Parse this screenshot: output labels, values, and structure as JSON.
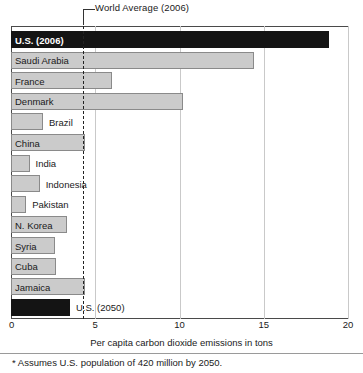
{
  "chart_data": {
    "type": "bar",
    "orientation": "horizontal",
    "title": "",
    "xlabel": "Per capita carbon dioxide emissions in tons",
    "ylabel": "",
    "xlim": [
      0,
      20
    ],
    "xticks": [
      "0",
      "5",
      "10",
      "15",
      "20"
    ],
    "xtick_values": [
      0,
      5,
      10,
      15,
      20
    ],
    "grid": true,
    "legend": "none",
    "categories": [
      "U.S. (2006)",
      "Saudi Arabia",
      "France",
      "Denmark",
      "Brazil",
      "China",
      "India",
      "Indonesia",
      "Pakistan",
      "N. Korea",
      "Syria",
      "Cuba",
      "Jamaica",
      "U.S. (2050)"
    ],
    "values": [
      18.9,
      14.4,
      6.0,
      10.2,
      1.9,
      4.4,
      1.1,
      1.7,
      0.9,
      3.3,
      2.6,
      2.7,
      4.4,
      3.5
    ],
    "highlight_categories": [
      "U.S. (2006)",
      "U.S. (2050)"
    ],
    "annotations": [
      {
        "name": "world-average",
        "label": "World Average (2006)",
        "value": 4.3,
        "style": "dashed vertical line"
      }
    ],
    "footnote": "* Assumes U.S. population of 420 million by 2050.",
    "colors": {
      "bar_fill": "#cbcbcb",
      "bar_border": "#8a8a8a",
      "highlight_fill": "#141414",
      "highlight_text": "#ffffff",
      "gridline": "#c9c9c9",
      "axis": "#4a4a4a",
      "text": "#1a1a1a",
      "background": "#ffffff"
    }
  }
}
